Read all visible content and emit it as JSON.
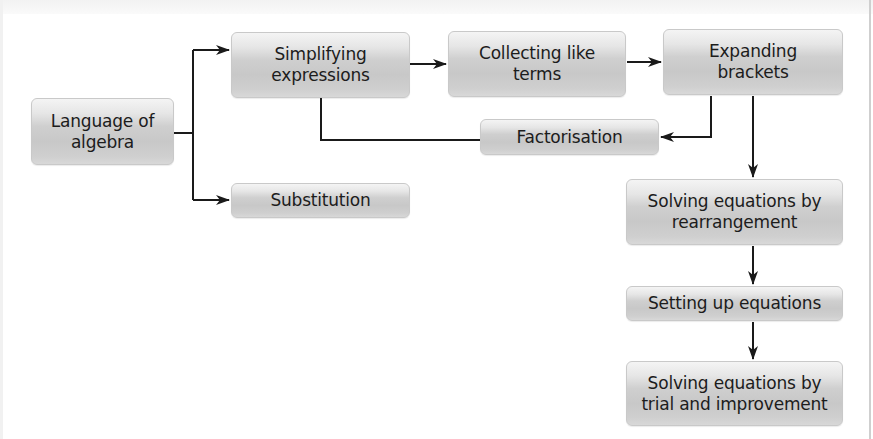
{
  "diagram": {
    "type": "flowchart",
    "nodes": {
      "language_of_algebra": {
        "label": "Language of\nalgebra"
      },
      "simplifying_expressions": {
        "label": "Simplifying\nexpressions"
      },
      "substitution": {
        "label": "Substitution"
      },
      "collecting_like_terms": {
        "label": "Collecting like\nterms"
      },
      "expanding_brackets": {
        "label": "Expanding\nbrackets"
      },
      "factorisation": {
        "label": "Factorisation"
      },
      "solving_by_rearrangement": {
        "label": "Solving equations by\nrearrangement"
      },
      "setting_up_equations": {
        "label": "Setting up equations"
      },
      "solving_by_trial_and_improvement": {
        "label": "Solving equations by\ntrial and improvement"
      }
    },
    "edges": [
      {
        "from": "Language of algebra",
        "to": "Simplifying expressions"
      },
      {
        "from": "Language of algebra",
        "to": "Substitution"
      },
      {
        "from": "Simplifying expressions",
        "to": "Collecting like terms"
      },
      {
        "from": "Collecting like terms",
        "to": "Expanding brackets"
      },
      {
        "from": "Expanding brackets",
        "to": "Factorisation"
      },
      {
        "from": "Simplifying expressions",
        "to": "Factorisation",
        "style": "line"
      },
      {
        "from": "Expanding brackets",
        "to": "Solving equations by rearrangement"
      },
      {
        "from": "Solving equations by rearrangement",
        "to": "Setting up equations"
      },
      {
        "from": "Setting up equations",
        "to": "Solving equations by trial and improvement"
      }
    ],
    "colors": {
      "node_fill_top": "#f4f4f4",
      "node_fill_mid": "#c8c8c8",
      "node_border": "#c9c9c9",
      "text": "#1c1c1c",
      "connector": "#1a1a1a",
      "background": "#ffffff"
    }
  }
}
